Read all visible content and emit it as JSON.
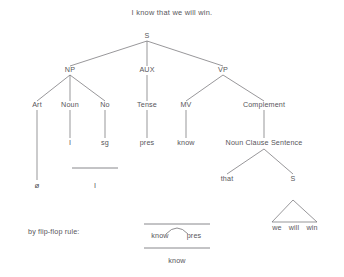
{
  "figure": {
    "title": "I know that we will win.",
    "note": "by flip-flop rule:",
    "background_color": "#ffffff",
    "ink_color": "#57565a",
    "line_color": "#6b6a6e"
  },
  "tree": {
    "root": "S",
    "nodes": {
      "s_root": "S",
      "np": "NP",
      "aux": "AUX",
      "vp": "VP",
      "art": "Art",
      "noun": "Noun",
      "no": "No",
      "tense": "Tense",
      "mv": "MV",
      "complement": "Complement",
      "noun_clause_sentence": "Noun Clause Sentence",
      "i_terminal": "I",
      "sg": "sg",
      "pres": "pres",
      "know": "know",
      "that": "that",
      "s_embedded": "S",
      "phi": "ø",
      "i_collapsed": "I",
      "we": "we",
      "will": "will",
      "win": "win"
    }
  },
  "flip_flop": {
    "label": "by flip-flop rule:",
    "numerator_left": "know",
    "numerator_right": "pres",
    "result": "know"
  }
}
